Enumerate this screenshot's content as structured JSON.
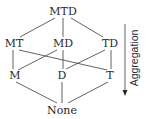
{
  "diagram": {
    "type": "lattice",
    "nodes": [
      {
        "id": "MTD",
        "label": "MTD",
        "x": 63,
        "y": 15
      },
      {
        "id": "MT",
        "label": "MT",
        "x": 14,
        "y": 47
      },
      {
        "id": "MD",
        "label": "MD",
        "x": 63,
        "y": 47
      },
      {
        "id": "TD",
        "label": "TD",
        "x": 110,
        "y": 47
      },
      {
        "id": "M",
        "label": "M",
        "x": 14,
        "y": 79
      },
      {
        "id": "D",
        "label": "D",
        "x": 62,
        "y": 79
      },
      {
        "id": "T",
        "label": "T",
        "x": 110,
        "y": 79
      },
      {
        "id": "None",
        "label": "None",
        "x": 62,
        "y": 114
      }
    ],
    "edges": [
      [
        "MTD",
        "MT"
      ],
      [
        "MTD",
        "MD"
      ],
      [
        "MTD",
        "TD"
      ],
      [
        "MT",
        "M"
      ],
      [
        "MT",
        "T"
      ],
      [
        "MD",
        "M"
      ],
      [
        "MD",
        "D"
      ],
      [
        "TD",
        "D"
      ],
      [
        "TD",
        "T"
      ],
      [
        "M",
        "None"
      ],
      [
        "D",
        "None"
      ],
      [
        "T",
        "None"
      ]
    ],
    "axis": {
      "label": "Aggregation",
      "direction": "down"
    }
  }
}
